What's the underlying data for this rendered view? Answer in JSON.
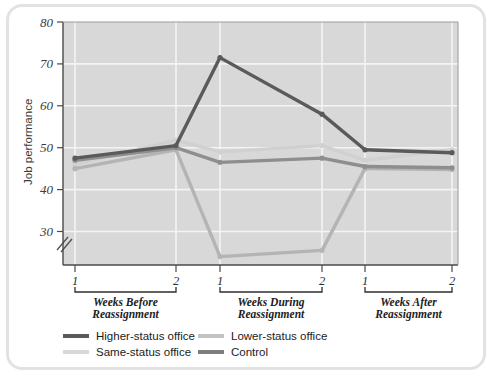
{
  "figure": {
    "border_color": "#e2e2e2",
    "plot_bg": "#d8d8d8",
    "grid_color": "#f4f4f4",
    "axis_color": "#4a4a4a"
  },
  "chart_data": {
    "type": "line",
    "title": "",
    "xlabel": "",
    "ylabel": "Job performance",
    "ylim": [
      22,
      80
    ],
    "yticks": [
      30,
      40,
      50,
      60,
      70,
      80
    ],
    "ytick_labels": [
      "30",
      "40",
      "50",
      "60",
      "70",
      "80"
    ],
    "axis_break": true,
    "axis_break_symbol": "//",
    "grid": true,
    "grid_orientation": "both",
    "legend_position": "below",
    "x": [
      "1",
      "2",
      "1",
      "2",
      "1",
      "2"
    ],
    "xtick_labels": [
      "1",
      "2",
      "1",
      "2",
      "1",
      "2"
    ],
    "x_groups": [
      {
        "label": "Weeks Before Reassignment",
        "line1": "Weeks Before",
        "line2": "Reassignment",
        "from": 0,
        "to": 1
      },
      {
        "label": "Weeks During Reassignment",
        "line1": "Weeks During",
        "line2": "Reassignment",
        "from": 2,
        "to": 3
      },
      {
        "label": "Weeks After Reassignment",
        "line1": "Weeks After",
        "line2": "Reassignment",
        "from": 4,
        "to": 5
      }
    ],
    "series": [
      {
        "name": "Higher-status office",
        "color": "#5a5a5a",
        "width": 3.4,
        "values": [
          47.5,
          50.5,
          71.5,
          58.0,
          49.5,
          48.8
        ]
      },
      {
        "name": "Same-status office",
        "color": "#d0d0d0",
        "width": 3.4,
        "values": [
          46.0,
          51.8,
          49.0,
          50.5,
          47.0,
          49.5
        ]
      },
      {
        "name": "Lower-status office",
        "color": "#b4b4b4",
        "width": 3.4,
        "values": [
          45.0,
          49.5,
          24.0,
          25.5,
          45.0,
          44.8
        ]
      },
      {
        "name": "Control",
        "color": "#8e8e8e",
        "width": 3.4,
        "values": [
          47.0,
          50.0,
          46.5,
          47.5,
          45.5,
          45.2
        ]
      }
    ],
    "legend": [
      {
        "label": "Higher-status office",
        "color": "#5a5a5a"
      },
      {
        "label": "Lower-status office",
        "color": "#c4c4c4"
      },
      {
        "label": "Same-status office",
        "color": "#d8d8d8"
      },
      {
        "label": "Control",
        "color": "#7e7e7e"
      }
    ]
  }
}
